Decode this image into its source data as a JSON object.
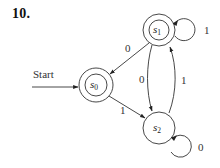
{
  "figure": {
    "title": "10.",
    "type": "finite-state automaton",
    "colors": {
      "stroke": "#333333",
      "text": "#222222",
      "background": "#ffffff"
    }
  },
  "start": {
    "label": "Start",
    "target": "s0"
  },
  "states": [
    {
      "id": "s0",
      "letter": "s",
      "sub": "0",
      "accepting": true,
      "initial": true
    },
    {
      "id": "s1",
      "letter": "s",
      "sub": "1",
      "accepting": true,
      "initial": false
    },
    {
      "id": "s2",
      "letter": "s",
      "sub": "2",
      "accepting": false,
      "initial": false
    }
  ],
  "transitions": [
    {
      "from": "s1",
      "to": "s0",
      "label": "0"
    },
    {
      "from": "s1",
      "to": "s1",
      "label": "1"
    },
    {
      "from": "s1",
      "to": "s2",
      "label": "0"
    },
    {
      "from": "s2",
      "to": "s1",
      "label": "1"
    },
    {
      "from": "s0",
      "to": "s2",
      "label": "1"
    },
    {
      "from": "s2",
      "to": "s2",
      "label": "0"
    }
  ]
}
